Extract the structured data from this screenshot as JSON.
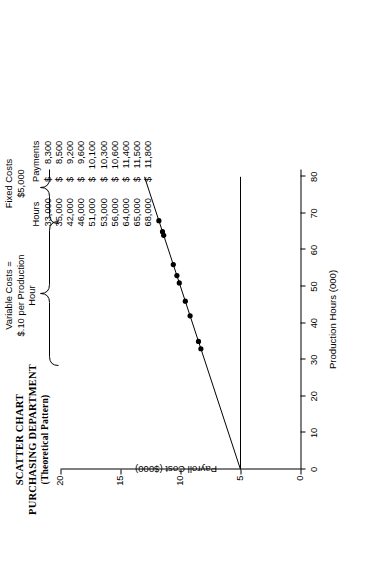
{
  "title": {
    "line1": "SCATTER CHART",
    "line2": "PURCHASING DEPARTMENT",
    "line3": "(Theoretical Pattern)"
  },
  "table": {
    "headers": [
      "Hours",
      "Payments"
    ],
    "currency_symbol": "$",
    "rows": [
      {
        "hours": "33,000",
        "payment": "8,300"
      },
      {
        "hours": "35,000",
        "payment": "8,500"
      },
      {
        "hours": "42,000",
        "payment": "9,200"
      },
      {
        "hours": "46,000",
        "payment": "9,600"
      },
      {
        "hours": "51,000",
        "payment": "10,100"
      },
      {
        "hours": "53,000",
        "payment": "10,300"
      },
      {
        "hours": "56,000",
        "payment": "10,600"
      },
      {
        "hours": "64,000",
        "payment": "11,400"
      },
      {
        "hours": "65,000",
        "payment": "11,500"
      },
      {
        "hours": "68,000",
        "payment": "11,800"
      }
    ]
  },
  "annotations": {
    "variable_costs": "Variable Costs =\n$.10 per Production\nHour",
    "fixed_costs": "Fixed Costs\n$5,000"
  },
  "chart_data": {
    "type": "scatter",
    "title": "SCATTER CHART PURCHASING DEPARTMENT (Theoretical Pattern)",
    "xlabel": "Production Hours (000)",
    "ylabel": "Payroll Cost ($000)",
    "xlim": [
      0,
      82
    ],
    "ylim": [
      0,
      20
    ],
    "xticks": [
      0,
      10,
      20,
      30,
      40,
      50,
      60,
      70,
      80
    ],
    "yticks": [
      0,
      5,
      10,
      15,
      20
    ],
    "grid": false,
    "legend": "none",
    "points": [
      {
        "x": 33,
        "y": 8.3
      },
      {
        "x": 35,
        "y": 8.5
      },
      {
        "x": 42,
        "y": 9.2
      },
      {
        "x": 46,
        "y": 9.6
      },
      {
        "x": 51,
        "y": 10.1
      },
      {
        "x": 53,
        "y": 10.3
      },
      {
        "x": 56,
        "y": 10.6
      },
      {
        "x": 64,
        "y": 11.4
      },
      {
        "x": 65,
        "y": 11.5
      },
      {
        "x": 68,
        "y": 11.8
      }
    ],
    "series": [
      {
        "name": "Total cost line",
        "type": "line",
        "x": [
          0,
          80
        ],
        "y": [
          5.0,
          13.0
        ]
      },
      {
        "name": "Fixed cost line",
        "type": "line",
        "x": [
          0,
          80
        ],
        "y": [
          5.0,
          5.0
        ]
      }
    ],
    "annotations": [
      {
        "text": "Variable Costs = $.10 per Production Hour",
        "x": 80,
        "y_range": [
          5.0,
          13.0
        ]
      },
      {
        "text": "Fixed Costs $5,000",
        "x": 80,
        "y_range": [
          0,
          5.0
        ]
      }
    ]
  },
  "colors": {
    "ink": "#000000",
    "background": "#ffffff"
  }
}
